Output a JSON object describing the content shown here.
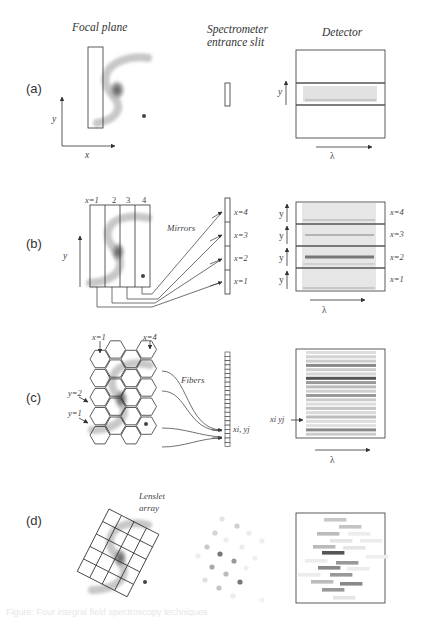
{
  "headers": {
    "focal_plane": "Focal plane",
    "slit_line1": "Spectrometer",
    "slit_line2": "entrance slit",
    "detector": "Detector"
  },
  "panels": {
    "a": {
      "tag": "(a)",
      "axis_x": "x",
      "axis_y": "y",
      "det_y": "y",
      "det_lambda": "λ"
    },
    "b": {
      "tag": "(b)",
      "strip_labels": [
        "x=1",
        "2",
        "3",
        "4"
      ],
      "mirrors_label": "Mirrors",
      "axis_y": "y",
      "slit_labels": [
        "x=4",
        "x=3",
        "x=2",
        "x=1"
      ],
      "det_labels": [
        "x=4",
        "x=3",
        "x=2",
        "x=1"
      ],
      "det_y": "y",
      "det_lambda": "λ"
    },
    "c": {
      "tag": "(c)",
      "col_labels": [
        "x=1",
        "x=4"
      ],
      "row_labels": [
        "y=2",
        "y=1"
      ],
      "fibers_label": "Fibers",
      "slit_label": "xi, yj",
      "det_pointer_label": "xi yj",
      "det_lambda": "λ"
    },
    "d": {
      "tag": "(d)",
      "lenslet_line1": "Lenslet",
      "lenslet_line2": "array"
    }
  },
  "caption": "Figure: Four integral field spectroscopy techniques"
}
